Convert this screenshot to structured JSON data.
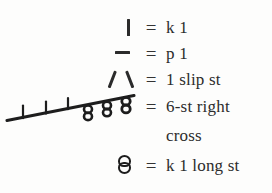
{
  "legend": {
    "title": "Knitting chart symbol key",
    "equals_sign": "=",
    "rows": [
      {
        "symbol_name": "knit-stitch-symbol",
        "symbol_glyph": "|",
        "description": "k 1"
      },
      {
        "symbol_name": "purl-stitch-symbol",
        "symbol_glyph": "—",
        "description": "p 1"
      },
      {
        "symbol_name": "slip-stitch-symbol",
        "symbol_glyph": "V",
        "description": "1 slip st"
      },
      {
        "symbol_name": "six-stitch-right-cross-cable-symbol",
        "symbol_glyph": "cable",
        "description": "6-st right",
        "description_line2": "cross"
      },
      {
        "symbol_name": "long-stitch-symbol",
        "symbol_glyph": "8",
        "description": "k 1 long st"
      }
    ],
    "cable_diagram": {
      "name": "cable-cross-diagram",
      "knit_bars": 3,
      "long_stitch_bobbles": 3,
      "direction": "right",
      "stitch_count": 6
    }
  },
  "colors": {
    "ink": "#2b2b2b",
    "background": "#fdfdfc"
  }
}
